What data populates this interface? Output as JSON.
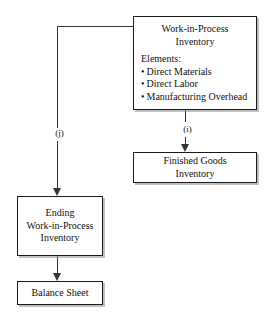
{
  "diagram": {
    "colors": {
      "box_border": "#1a1a1a",
      "box_fill": "#ffffff",
      "connector": "#333333",
      "shadow": "#8c8c8c",
      "text": "#111111"
    },
    "nodes": {
      "work_in_process": {
        "title_line1": "Work-in-Process",
        "title_line2": "Inventory",
        "elements_heading": "Elements:",
        "elements": [
          "Direct Materials",
          "Direct Labor",
          "Manufacturing Overhead"
        ],
        "bullet": "•"
      },
      "finished_goods": {
        "line1": "Finished Goods",
        "line2": "Inventory"
      },
      "ending_work_in_process": {
        "line1": "Ending",
        "line2": "Work-in-Process",
        "line3": "Inventory"
      },
      "balance_sheet": {
        "line1": "Balance Sheet"
      }
    },
    "edge_labels": {
      "to_ending_wip": "(j)",
      "to_finished_goods": "(i)"
    }
  }
}
